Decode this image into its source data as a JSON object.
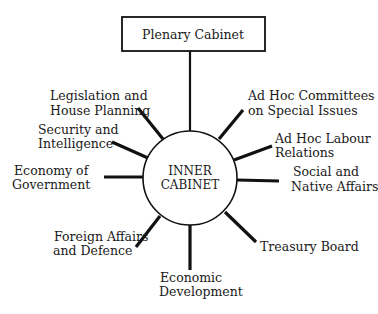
{
  "diagram": {
    "type": "hub-and-spoke organizational chart",
    "top_node": {
      "label": "Plenary Cabinet"
    },
    "hub": {
      "line1": "INNER",
      "line2": "CABINET"
    },
    "committees": [
      {
        "id": "legislation",
        "line1": "Legislation and",
        "line2": "House Planning"
      },
      {
        "id": "security",
        "line1": "Security and",
        "line2": "Intelligence"
      },
      {
        "id": "economy-gov",
        "line1": "Economy of",
        "line2": "Government"
      },
      {
        "id": "foreign",
        "line1": "Foreign Affairs",
        "line2": "and Defence"
      },
      {
        "id": "economic-dev",
        "line1": "Economic",
        "line2": "Development"
      },
      {
        "id": "treasury",
        "line1": "Treasury Board",
        "line2": ""
      },
      {
        "id": "social",
        "line1": "Social and",
        "line2": "Native Affairs"
      },
      {
        "id": "labour",
        "line1": "Ad Hoc Labour",
        "line2": "Relations"
      },
      {
        "id": "adhoc-special",
        "line1": "Ad Hoc Committees",
        "line2": "on Special Issues"
      }
    ]
  }
}
